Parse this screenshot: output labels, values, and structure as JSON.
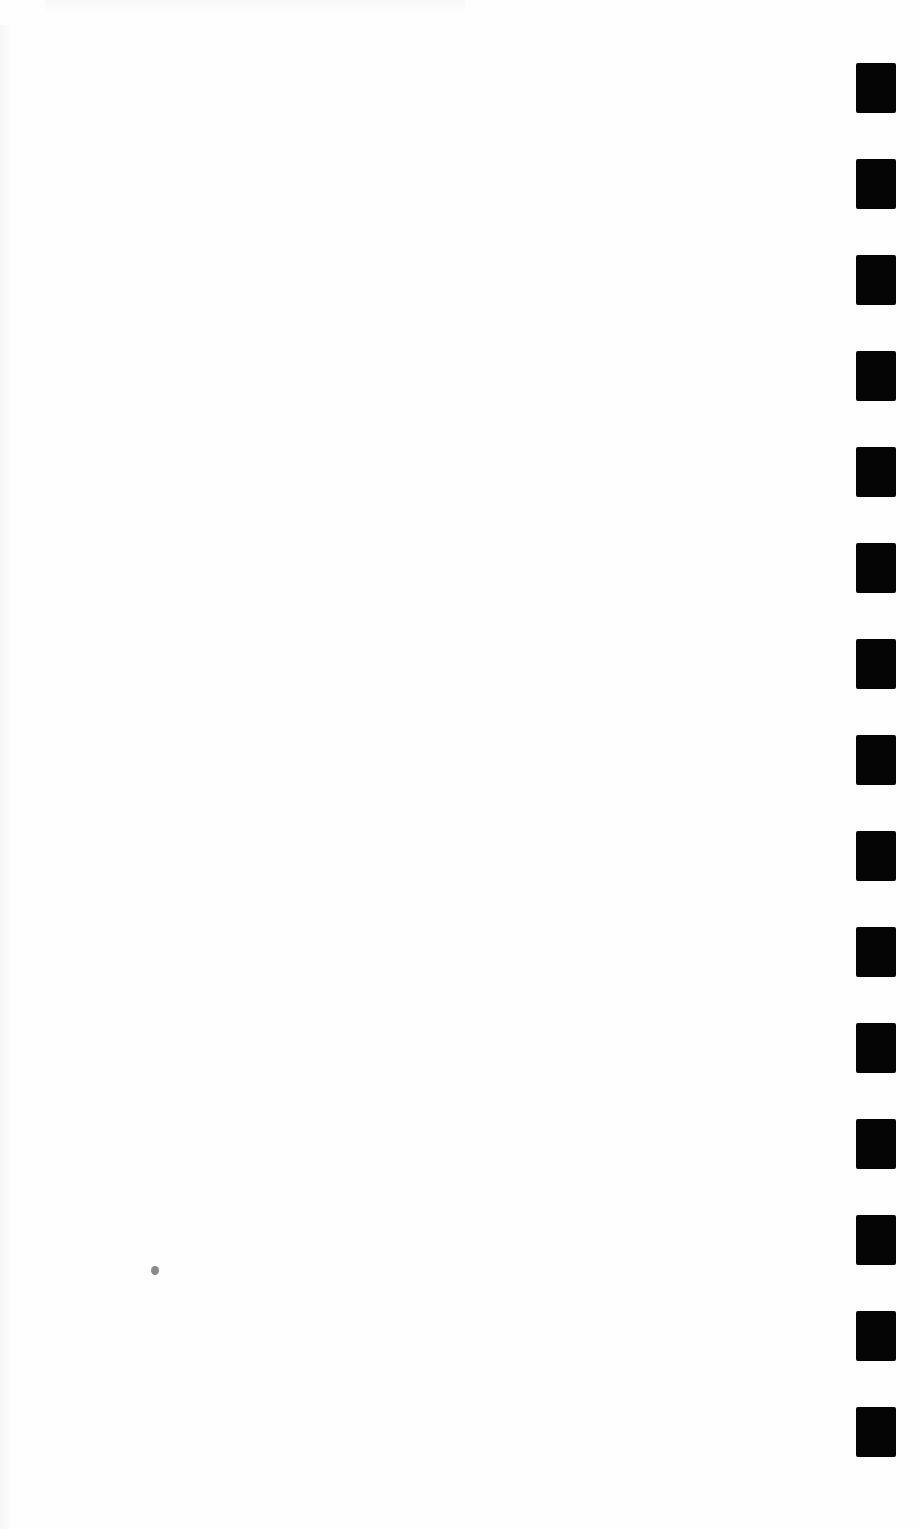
{
  "document": {
    "type": "blank scanned page",
    "text": ""
  },
  "marks": {
    "count": 15,
    "color": "#050505",
    "x": 856,
    "width": 40,
    "height": 50,
    "first_top": 63,
    "spacing": 96
  },
  "speck": {
    "x": 151,
    "y": 1266,
    "color": "#8a8a8a"
  }
}
